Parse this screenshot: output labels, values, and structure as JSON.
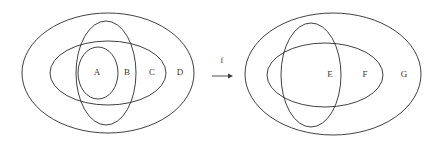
{
  "figure": {
    "kind": "set-diagram",
    "background_color": "#ffffff",
    "stroke_color": "#2b2b2b",
    "text_color": "#3a3a3a",
    "width": 443,
    "height": 147
  },
  "left_diagram": {
    "name": "domain-venn-diagram",
    "labels": [
      {
        "id": "A",
        "text": "A",
        "x": 97,
        "y": 73
      },
      {
        "id": "B",
        "text": "B",
        "x": 127,
        "y": 73
      },
      {
        "id": "C",
        "text": "C",
        "x": 152,
        "y": 73
      },
      {
        "id": "D",
        "text": "D",
        "x": 180,
        "y": 73
      }
    ],
    "ellipses": [
      {
        "id": "D",
        "name": "outer-ellipse-d",
        "cx": 108,
        "cy": 73,
        "rx": 86,
        "ry": 60
      },
      {
        "id": "C",
        "name": "horizontal-ellipse-c",
        "cx": 108,
        "cy": 73,
        "rx": 58,
        "ry": 32
      },
      {
        "id": "B",
        "name": "vertical-ellipse-b",
        "cx": 106,
        "cy": 73,
        "rx": 30,
        "ry": 52
      },
      {
        "id": "A",
        "name": "inner-ellipse-a",
        "cx": 98,
        "cy": 73,
        "rx": 20,
        "ry": 26
      }
    ]
  },
  "mapping": {
    "name": "function-arrow",
    "label": "f",
    "label_x": 222,
    "label_y": 61,
    "arrow_x1": 212,
    "arrow_x2": 233,
    "arrow_y": 76
  },
  "right_diagram": {
    "name": "codomain-venn-diagram",
    "labels": [
      {
        "id": "E",
        "text": "E",
        "x": 330,
        "y": 75
      },
      {
        "id": "F",
        "text": "F",
        "x": 365,
        "y": 75
      },
      {
        "id": "G",
        "text": "G",
        "x": 404,
        "y": 75
      }
    ],
    "ellipses": [
      {
        "id": "G",
        "name": "outer-ellipse-g",
        "cx": 333,
        "cy": 74,
        "rx": 88,
        "ry": 61
      },
      {
        "id": "F",
        "name": "horizontal-ellipse-f",
        "cx": 325,
        "cy": 75,
        "rx": 58,
        "ry": 32
      },
      {
        "id": "E",
        "name": "vertical-ellipse-e",
        "cx": 311,
        "cy": 75,
        "rx": 30,
        "ry": 52
      }
    ]
  }
}
